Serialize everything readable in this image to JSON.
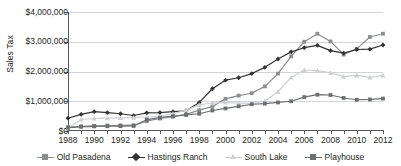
{
  "chart_data": {
    "type": "line",
    "title": "",
    "xlabel": "",
    "ylabel": "Sales Tax",
    "ylim": [
      0,
      4000000
    ],
    "yticks": [
      0,
      1000000,
      2000000,
      3000000,
      4000000
    ],
    "ytick_labels": [
      "$0",
      "$1,000,000",
      "$2,000,000",
      "$3,000,000",
      "$4,000,000"
    ],
    "grid": true,
    "legend_position": "bottom",
    "x": [
      1988,
      1989,
      1990,
      1991,
      1992,
      1993,
      1994,
      1995,
      1996,
      1997,
      1998,
      1999,
      2000,
      2001,
      2002,
      2003,
      2004,
      2005,
      2006,
      2007,
      2008,
      2009,
      2010,
      2011,
      2012
    ],
    "xtick_labels": [
      "1988",
      "1990",
      "1992",
      "1994",
      "1996",
      "1998",
      "2000",
      "2002",
      "2004",
      "2006",
      "2008",
      "2010",
      "2012"
    ],
    "xticks": [
      1988,
      1990,
      1992,
      1994,
      1996,
      1998,
      2000,
      2002,
      2004,
      2006,
      2008,
      2010,
      2012
    ],
    "series": [
      {
        "name": "Old Pasadena",
        "color": "#8c8d8f",
        "marker": "square",
        "values": [
          130000,
          160000,
          175000,
          185000,
          190000,
          195000,
          330000,
          420000,
          480000,
          560000,
          700000,
          820000,
          1080000,
          1190000,
          1270000,
          1500000,
          1930000,
          2510000,
          3000000,
          3270000,
          3010000,
          2570000,
          2760000,
          3160000,
          3270000
        ]
      },
      {
        "name": "Hastings Ranch",
        "color": "#333333",
        "marker": "diamond",
        "values": [
          430000,
          560000,
          650000,
          620000,
          580000,
          520000,
          610000,
          620000,
          650000,
          680000,
          960000,
          1420000,
          1710000,
          1790000,
          1930000,
          2140000,
          2420000,
          2660000,
          2800000,
          2880000,
          2700000,
          2620000,
          2740000,
          2750000,
          2890000
        ]
      },
      {
        "name": "South Lake",
        "color": "#cfd0d2",
        "marker": "triangle",
        "values": [
          110000,
          390000,
          420000,
          430000,
          440000,
          450000,
          470000,
          500000,
          580000,
          700000,
          880000,
          940000,
          960000,
          940000,
          930000,
          1010000,
          1320000,
          1800000,
          2050000,
          2030000,
          1960000,
          1830000,
          1870000,
          1800000,
          1870000
        ]
      },
      {
        "name": "Playhouse",
        "color": "#6d6e70",
        "marker": "square",
        "values": [
          115000,
          140000,
          155000,
          160000,
          165000,
          170000,
          380000,
          450000,
          500000,
          540000,
          580000,
          690000,
          760000,
          830000,
          900000,
          920000,
          960000,
          1000000,
          1140000,
          1220000,
          1210000,
          1110000,
          1050000,
          1060000,
          1090000
        ]
      }
    ]
  }
}
